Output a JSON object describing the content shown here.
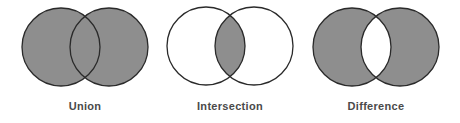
{
  "diagrams": [
    {
      "label": "Union",
      "cx1": 61,
      "cx2": 109,
      "cy": 47,
      "r": 39,
      "shade": "both"
    },
    {
      "label": "Intersection",
      "cx1": 206,
      "cx2": 254,
      "cy": 46,
      "r": 39,
      "shade": "intersection"
    },
    {
      "label": "Difference",
      "cx1": 352,
      "cx2": 400,
      "cy": 47,
      "r": 39,
      "shade": "symmetric-difference"
    }
  ],
  "colors": {
    "fill": "#8e8e8e",
    "stroke": "#2a2a2a",
    "text": "#4a4a4a",
    "background": "#ffffff"
  }
}
